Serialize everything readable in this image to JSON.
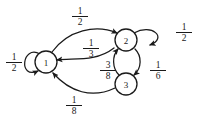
{
  "diagram": {
    "type": "markov-chain-state-diagram",
    "title": "",
    "nodes": [
      {
        "id": "1",
        "label": "1",
        "cx": 46,
        "cy": 62,
        "r": 11
      },
      {
        "id": "2",
        "label": "2",
        "cx": 126,
        "cy": 40,
        "r": 11
      },
      {
        "id": "3",
        "label": "3",
        "cx": 126,
        "cy": 84,
        "r": 11
      }
    ],
    "edges": [
      {
        "id": "e-1-1",
        "from": "1",
        "to": "1",
        "kind": "self-loop",
        "direction": "left",
        "label": {
          "num": "1",
          "den": "2",
          "text": "1/2"
        }
      },
      {
        "id": "e-1-2-top",
        "from": "1",
        "to": "2",
        "kind": "arc",
        "direction": "right",
        "label": {
          "num": "1",
          "den": "2",
          "text": "1/2"
        }
      },
      {
        "id": "e-2-1-mid",
        "from": "2",
        "to": "1",
        "kind": "arc",
        "direction": "right",
        "label": {
          "num": "1",
          "den": "3",
          "text": "1/3"
        }
      },
      {
        "id": "e-3-2",
        "from": "3",
        "to": "2",
        "kind": "arc",
        "direction": "up",
        "label": {
          "num": "3",
          "den": "8",
          "text": "3/8"
        }
      },
      {
        "id": "e-2-3",
        "from": "2",
        "to": "3",
        "kind": "arc",
        "direction": "down",
        "label": {
          "num": "1",
          "den": "6",
          "text": "1/6"
        }
      },
      {
        "id": "e-2-2",
        "from": "2",
        "to": "2",
        "kind": "self-loop",
        "direction": "right",
        "label": {
          "num": "1",
          "den": "2",
          "text": "1/2"
        }
      },
      {
        "id": "e-3-1",
        "from": "3",
        "to": "1",
        "kind": "arc",
        "direction": "left",
        "label": {
          "num": "1",
          "den": "8",
          "text": "1/8"
        }
      }
    ],
    "colors": {
      "stroke": "#1a1a1a",
      "background": "#ffffff",
      "node_fill": "#ffffff"
    }
  }
}
